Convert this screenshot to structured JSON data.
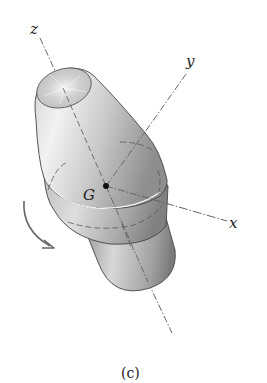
{
  "figure": {
    "caption": "(c)",
    "axes": {
      "x_label": "x",
      "y_label": "y",
      "z_label": "z"
    },
    "center_label": "G",
    "rotation_arrow": "curved-arrow-clockwise",
    "body": "truncated cone on collar and cylinder"
  }
}
